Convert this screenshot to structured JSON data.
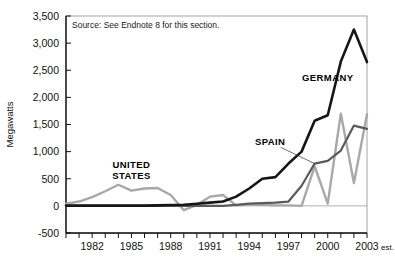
{
  "chart_data": {
    "type": "line",
    "title": "",
    "subtitle": "",
    "xlabel": "",
    "ylabel": "Megawatts",
    "source_note": "Source: See Endnote 8 for this section.",
    "ylim": [
      -500,
      3500
    ],
    "ytick_values": [
      -500,
      0,
      500,
      1000,
      1500,
      2000,
      2500,
      3000,
      3500
    ],
    "ytick_labels": [
      "-500",
      "0",
      "500",
      "1,000",
      "1,500",
      "2,000",
      "2,500",
      "3,000",
      "3,500"
    ],
    "xlim": [
      1980,
      2003
    ],
    "xtick_values": [
      1980,
      1981,
      1982,
      1983,
      1984,
      1985,
      1986,
      1987,
      1988,
      1989,
      1990,
      1991,
      1992,
      1993,
      1994,
      1995,
      1996,
      1997,
      1998,
      1999,
      2000,
      2001,
      2002,
      2003
    ],
    "xtick_labeled": [
      1982,
      1985,
      1988,
      1991,
      1994,
      1997,
      2000,
      2003
    ],
    "xtick_labels": [
      "1982",
      "1985",
      "1988",
      "1991",
      "1994",
      "1997",
      "2000",
      "2003"
    ],
    "last_tick_suffix": "est.",
    "grid": false,
    "zero_line": true,
    "legend_position": "inline-annotations",
    "x": [
      1980,
      1981,
      1982,
      1983,
      1984,
      1985,
      1986,
      1987,
      1988,
      1989,
      1990,
      1991,
      1992,
      1993,
      1994,
      1995,
      1996,
      1997,
      1998,
      1999,
      2000,
      2001,
      2002,
      2003
    ],
    "series": [
      {
        "name": "GERMANY",
        "color": "#161616",
        "width": 2.6,
        "label_x": 2000.0,
        "label_y": 2300,
        "values": [
          5,
          5,
          5,
          5,
          5,
          5,
          5,
          10,
          15,
          20,
          40,
          60,
          80,
          170,
          320,
          500,
          530,
          780,
          1000,
          1570,
          1670,
          2660,
          3250,
          2650
        ]
      },
      {
        "name": "SPAIN",
        "color": "#5a5a5a",
        "width": 2.2,
        "label_x": 1995.6,
        "label_y": 1120,
        "leader": [
          [
            1996.4,
            1080
          ],
          [
            1999.0,
            780
          ]
        ],
        "values": [
          0,
          0,
          0,
          0,
          0,
          0,
          0,
          0,
          0,
          0,
          0,
          0,
          0,
          20,
          40,
          50,
          60,
          80,
          370,
          780,
          830,
          1020,
          1480,
          1420
        ]
      },
      {
        "name": "UNITED STATES",
        "color": "#a8a8a8",
        "width": 2.4,
        "label_x": 1985.0,
        "label_y": 700,
        "label_lines": [
          "UNITED",
          "STATES"
        ],
        "values": [
          40,
          80,
          160,
          270,
          390,
          280,
          320,
          330,
          200,
          -80,
          20,
          170,
          200,
          10,
          30,
          20,
          10,
          10,
          0,
          730,
          40,
          1700,
          420,
          1690
        ]
      }
    ]
  }
}
